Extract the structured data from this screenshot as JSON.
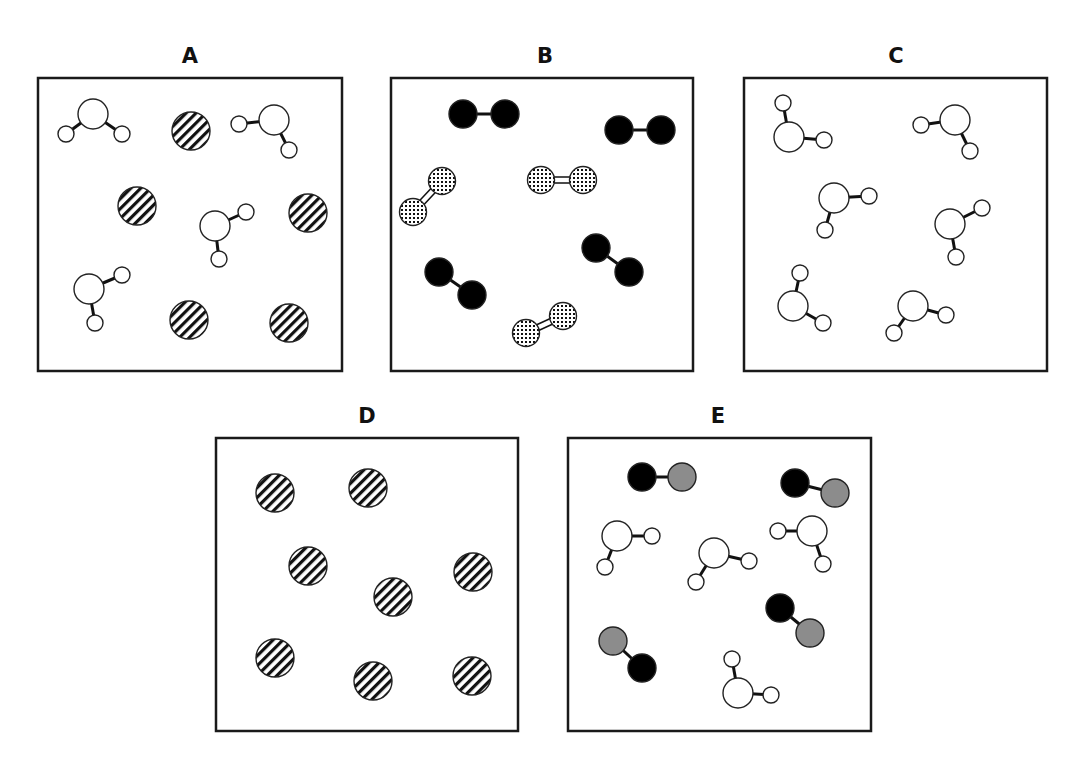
{
  "figure": {
    "panels": [
      {
        "id": "A",
        "label": "A",
        "description": "mixture of water molecules and single striped atoms",
        "molecules": [
          {
            "type": "water",
            "atoms": [
              [
                93,
                114
              ],
              [
                66,
                134
              ],
              [
                122,
                134
              ]
            ]
          },
          {
            "type": "atom-striped",
            "atoms": [
              [
                191,
                131
              ]
            ]
          },
          {
            "type": "water",
            "atoms": [
              [
                274,
                120
              ],
              [
                239,
                124
              ],
              [
                289,
                150
              ]
            ]
          },
          {
            "type": "atom-striped",
            "atoms": [
              [
                137,
                206
              ]
            ]
          },
          {
            "type": "atom-striped",
            "atoms": [
              [
                308,
                213
              ]
            ]
          },
          {
            "type": "water",
            "atoms": [
              [
                215,
                226
              ],
              [
                246,
                212
              ],
              [
                219,
                259
              ]
            ]
          },
          {
            "type": "water",
            "atoms": [
              [
                89,
                289
              ],
              [
                122,
                275
              ],
              [
                95,
                323
              ]
            ]
          },
          {
            "type": "atom-striped",
            "atoms": [
              [
                189,
                320
              ]
            ]
          },
          {
            "type": "atom-striped",
            "atoms": [
              [
                289,
                323
              ]
            ]
          }
        ]
      },
      {
        "id": "B",
        "label": "B",
        "description": "mixture of black diatomic molecules and dotted diatomic molecules with double bonds",
        "molecules": [
          {
            "type": "diatomic-black",
            "atoms": [
              [
                463,
                114
              ],
              [
                505,
                114
              ]
            ]
          },
          {
            "type": "diatomic-black",
            "atoms": [
              [
                619,
                130
              ],
              [
                661,
                130
              ]
            ]
          },
          {
            "type": "diatomic-dotted",
            "atoms": [
              [
                442,
                181
              ],
              [
                413,
                212
              ]
            ]
          },
          {
            "type": "diatomic-dotted",
            "atoms": [
              [
                541,
                180
              ],
              [
                583,
                180
              ]
            ]
          },
          {
            "type": "diatomic-black",
            "atoms": [
              [
                439,
                272
              ],
              [
                472,
                295
              ]
            ]
          },
          {
            "type": "diatomic-black",
            "atoms": [
              [
                596,
                248
              ],
              [
                629,
                272
              ]
            ]
          },
          {
            "type": "diatomic-dotted",
            "atoms": [
              [
                526,
                333
              ],
              [
                563,
                316
              ]
            ]
          }
        ]
      },
      {
        "id": "C",
        "label": "C",
        "description": "pure water molecules",
        "molecules": [
          {
            "type": "water",
            "atoms": [
              [
                789,
                137
              ],
              [
                783,
                103
              ],
              [
                824,
                140
              ]
            ]
          },
          {
            "type": "water",
            "atoms": [
              [
                955,
                120
              ],
              [
                921,
                125
              ],
              [
                970,
                151
              ]
            ]
          },
          {
            "type": "water",
            "atoms": [
              [
                834,
                198
              ],
              [
                869,
                196
              ],
              [
                825,
                230
              ]
            ]
          },
          {
            "type": "water",
            "atoms": [
              [
                950,
                224
              ],
              [
                982,
                208
              ],
              [
                956,
                257
              ]
            ]
          },
          {
            "type": "water",
            "atoms": [
              [
                793,
                306
              ],
              [
                800,
                273
              ],
              [
                823,
                323
              ]
            ]
          },
          {
            "type": "water",
            "atoms": [
              [
                913,
                306
              ],
              [
                894,
                333
              ],
              [
                946,
                315
              ]
            ]
          }
        ]
      },
      {
        "id": "D",
        "label": "D",
        "description": "pure single striped atoms",
        "molecules": [
          {
            "type": "atom-striped",
            "atoms": [
              [
                275,
                493
              ]
            ]
          },
          {
            "type": "atom-striped",
            "atoms": [
              [
                368,
                488
              ]
            ]
          },
          {
            "type": "atom-striped",
            "atoms": [
              [
                308,
                566
              ]
            ]
          },
          {
            "type": "atom-striped",
            "atoms": [
              [
                473,
                572
              ]
            ]
          },
          {
            "type": "atom-striped",
            "atoms": [
              [
                393,
                597
              ]
            ]
          },
          {
            "type": "atom-striped",
            "atoms": [
              [
                275,
                658
              ]
            ]
          },
          {
            "type": "atom-striped",
            "atoms": [
              [
                373,
                681
              ]
            ]
          },
          {
            "type": "atom-striped",
            "atoms": [
              [
                472,
                676
              ]
            ]
          }
        ]
      },
      {
        "id": "E",
        "label": "E",
        "description": "mixture of water molecules and black-gray diatomic molecules",
        "molecules": [
          {
            "type": "diatomic-black-gray",
            "atoms": [
              [
                642,
                477
              ],
              [
                682,
                477
              ]
            ]
          },
          {
            "type": "diatomic-black-gray",
            "atoms": [
              [
                795,
                483
              ],
              [
                835,
                493
              ]
            ]
          },
          {
            "type": "water",
            "atoms": [
              [
                617,
                536
              ],
              [
                652,
                536
              ],
              [
                605,
                567
              ]
            ]
          },
          {
            "type": "water",
            "atoms": [
              [
                714,
                553
              ],
              [
                749,
                561
              ],
              [
                696,
                582
              ]
            ]
          },
          {
            "type": "water",
            "atoms": [
              [
                812,
                531
              ],
              [
                778,
                531
              ],
              [
                823,
                564
              ]
            ]
          },
          {
            "type": "diatomic-black-gray",
            "atoms": [
              [
                780,
                608
              ],
              [
                810,
                633
              ]
            ]
          },
          {
            "type": "diatomic-black-gray",
            "atoms": [
              [
                642,
                668
              ],
              [
                613,
                641
              ]
            ]
          },
          {
            "type": "water",
            "atoms": [
              [
                738,
                693
              ],
              [
                732,
                659
              ],
              [
                771,
                695
              ]
            ]
          }
        ]
      }
    ],
    "colors": {
      "black_atom": "#000000",
      "gray_atom": "#8c8c8c",
      "white_atom": "#ffffff",
      "outline": "#222222"
    }
  }
}
